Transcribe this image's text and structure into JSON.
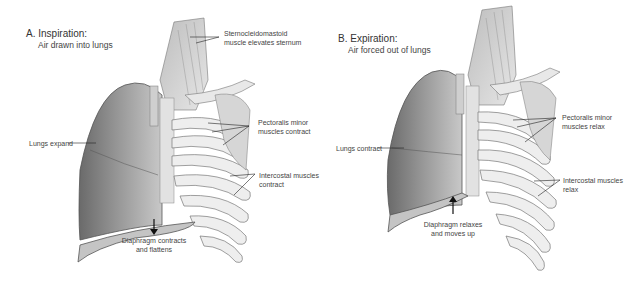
{
  "figure": {
    "panels": [
      {
        "id": "A",
        "title": "A. Inspiration:",
        "subtitle": "Air drawn into lungs",
        "labels": {
          "sternocleidomastoid": [
            "Sternocleidomastoid",
            "muscle elevates sternum"
          ],
          "pectoralis": [
            "Pectoralis minor",
            "muscles contract"
          ],
          "lungs": "Lungs expand",
          "intercostal": [
            "Intercostal muscles",
            "contract"
          ],
          "diaphragm": [
            "Diaphragm contracts",
            "and flattens"
          ]
        },
        "arrow_direction": "down"
      },
      {
        "id": "B",
        "title": "B. Expiration:",
        "subtitle": "Air forced out of lungs",
        "labels": {
          "pectoralis": [
            "Pectoralis minor",
            "muscles relax"
          ],
          "lungs": "Lungs contract",
          "intercostal": [
            "Intercostal muscles",
            "relax"
          ],
          "diaphragm": [
            "Diaphragm relaxes",
            "and moves up"
          ]
        },
        "arrow_direction": "up"
      }
    ]
  }
}
